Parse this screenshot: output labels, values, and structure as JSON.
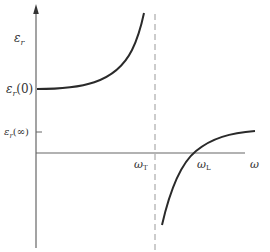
{
  "diagram": {
    "y_axis": {
      "label": "ε",
      "label_sub": "r"
    },
    "x_axis": {
      "label": "ω"
    },
    "y_ticks": [
      {
        "main": "ε",
        "sub": "r",
        "arg": "(0)"
      },
      {
        "main": "ε",
        "sub": "r",
        "arg": "(∞)"
      }
    ],
    "x_markers": [
      {
        "main": "ω",
        "sub": "T"
      },
      {
        "main": "ω",
        "sub": "L"
      }
    ],
    "colors": {
      "axis": "#666666",
      "curve": "#2a2a2a",
      "asymptote": "#999999"
    }
  }
}
